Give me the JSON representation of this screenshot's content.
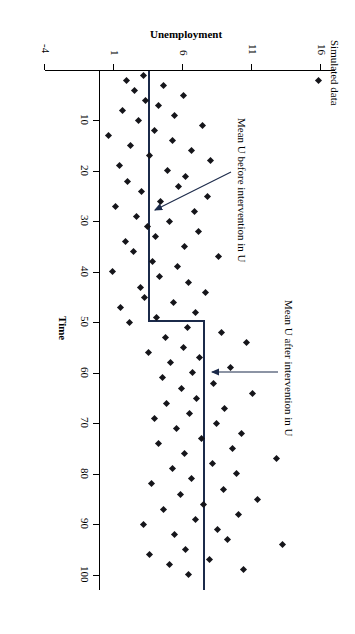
{
  "figure": {
    "title": "Simulated data",
    "caption": "",
    "annotations": [
      {
        "name": "mean-before-label",
        "text": "Mean U before intervention in U"
      },
      {
        "name": "mean-after-label",
        "text": "Mean U after intervention in U"
      }
    ]
  },
  "chart_data": {
    "type": "scatter",
    "title": "Simulated data",
    "xlabel": "Time",
    "ylabel": "Unemployment",
    "xlim": [
      0,
      103
    ],
    "ylim": [
      -4,
      17
    ],
    "xticks": [
      10,
      20,
      30,
      40,
      50,
      60,
      70,
      80,
      90,
      100
    ],
    "yticks": [
      -4,
      1,
      6,
      11,
      16
    ],
    "grid": false,
    "legend": "none",
    "series": [
      {
        "name": "Simulated unemployment",
        "x": [
          1,
          2,
          3,
          4,
          5,
          6,
          7,
          8,
          9,
          10,
          11,
          12,
          13,
          14,
          15,
          16,
          17,
          18,
          19,
          20,
          21,
          22,
          23,
          24,
          25,
          26,
          27,
          28,
          29,
          30,
          31,
          32,
          33,
          34,
          35,
          36,
          37,
          38,
          39,
          40,
          41,
          42,
          43,
          44,
          45,
          46,
          47,
          48,
          49,
          50,
          51,
          52,
          53,
          54,
          55,
          56,
          57,
          58,
          59,
          60,
          61,
          62,
          63,
          64,
          65,
          66,
          67,
          68,
          69,
          70,
          71,
          72,
          73,
          74,
          75,
          76,
          77,
          78,
          79,
          80,
          81,
          82,
          83,
          84,
          85,
          86,
          87,
          88,
          89,
          90,
          91,
          92,
          93,
          94,
          95,
          96,
          97,
          98,
          99,
          100
        ],
        "y": [
          3.1,
          1.9,
          4.6,
          2.5,
          6.0,
          3.3,
          4.2,
          1.6,
          5.4,
          2.8,
          7.4,
          3.9,
          0.6,
          5.2,
          2.2,
          6.6,
          3.6,
          8.0,
          1.4,
          4.9,
          6.2,
          2.0,
          5.7,
          3.0,
          7.8,
          4.4,
          1.1,
          6.8,
          2.6,
          5.0,
          3.4,
          7.1,
          4.0,
          1.8,
          6.1,
          2.4,
          8.6,
          3.8,
          5.6,
          0.9,
          4.3,
          6.4,
          2.9,
          7.6,
          3.2,
          5.3,
          1.5,
          6.9,
          4.1,
          2.1,
          6.3,
          8.8,
          4.7,
          10.6,
          6.0,
          3.5,
          7.2,
          5.1,
          9.4,
          6.7,
          4.5,
          8.2,
          5.9,
          11.0,
          7.0,
          4.8,
          9.0,
          6.5,
          3.9,
          8.4,
          5.5,
          10.2,
          7.3,
          4.2,
          9.6,
          6.1,
          12.8,
          8.1,
          5.2,
          9.9,
          6.6,
          3.7,
          8.9,
          5.8,
          11.4,
          7.5,
          4.6,
          10.0,
          6.9,
          3.1,
          8.5,
          5.4,
          9.2,
          13.2,
          6.2,
          3.6,
          7.9,
          5.0,
          10.4,
          6.4
        ]
      }
    ],
    "reference_lines": [
      {
        "name": "mean-before-intervention",
        "label": "Mean U before intervention in U",
        "value": 3.6,
        "x_start": 0,
        "x_end": 50
      },
      {
        "name": "mean-after-intervention",
        "label": "Mean U after intervention in U",
        "value": 6.6,
        "x_start": 51,
        "x_end": 100
      }
    ],
    "outliers": [
      {
        "x": 2,
        "y": 15.8
      }
    ]
  }
}
